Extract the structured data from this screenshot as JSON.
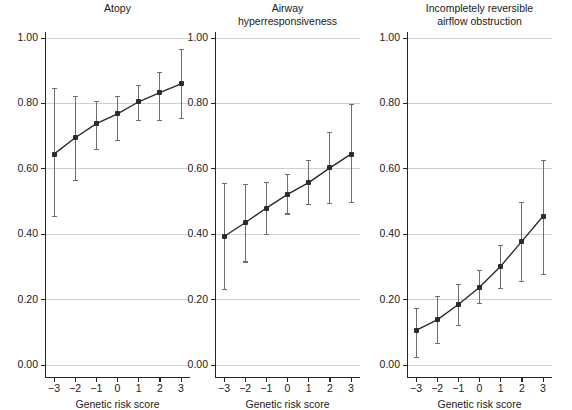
{
  "figure": {
    "width": 572,
    "height": 407,
    "background": "#ffffff",
    "marker_color": "#2b2b2b",
    "errorbar_color": "#6e6e6e",
    "grid_color": "#d2d2d2",
    "axis_color": "#262626"
  },
  "chart_data": {
    "type": "line",
    "title": "",
    "xlabel": "Genetic risk score",
    "ylabel": "",
    "x": [
      -3,
      -2,
      -1,
      0,
      1,
      2,
      3
    ],
    "xtick_labels": [
      "−3",
      "−2",
      "−1",
      "0",
      "1",
      "2",
      "3"
    ],
    "xlim": [
      -3.75,
      3.75
    ],
    "ylim": [
      0.0,
      1.0
    ],
    "ytick_values": [
      0.0,
      0.2,
      0.4,
      0.6,
      0.8,
      1.0
    ],
    "ytick_labels": [
      "0.00",
      "0.20",
      "0.40",
      "0.60",
      "0.80",
      "1.00"
    ],
    "grid": "horizontal",
    "legend": "none",
    "error_bars": "95% CI",
    "panels": [
      {
        "id": "atopy",
        "title": "Atopy",
        "values": [
          0.645,
          0.695,
          0.738,
          0.768,
          0.805,
          0.833,
          0.86
        ],
        "ci_low": [
          0.455,
          0.565,
          0.658,
          0.688,
          0.748,
          0.748,
          0.755
        ],
        "ci_high": [
          0.845,
          0.82,
          0.805,
          0.82,
          0.855,
          0.895,
          0.965
        ]
      },
      {
        "id": "airway-hyperresponsiveness",
        "title": "Airway\nhyperresponsiveness",
        "values": [
          0.393,
          0.435,
          0.48,
          0.522,
          0.558,
          0.603,
          0.645
        ],
        "ci_low": [
          0.232,
          0.315,
          0.4,
          0.462,
          0.492,
          0.495,
          0.497
        ],
        "ci_high": [
          0.555,
          0.553,
          0.558,
          0.583,
          0.625,
          0.712,
          0.797
        ]
      },
      {
        "id": "incompletely-reversible-airflow-obstruction",
        "title": "Incompletely reversible\nairflow obstruction",
        "values": [
          0.106,
          0.138,
          0.185,
          0.238,
          0.302,
          0.378,
          0.455
        ],
        "ci_low": [
          0.022,
          0.066,
          0.122,
          0.188,
          0.235,
          0.255,
          0.278
        ],
        "ci_high": [
          0.173,
          0.211,
          0.247,
          0.29,
          0.365,
          0.497,
          0.625
        ]
      }
    ]
  }
}
